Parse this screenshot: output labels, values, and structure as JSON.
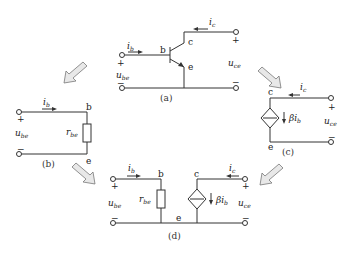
{
  "panels": {
    "a": {
      "caption": "(a)",
      "labels": {
        "ib": "i",
        "ib_sub": "b",
        "ic": "i",
        "ic_sub": "c",
        "b": "b",
        "c": "c",
        "e": "e",
        "ube": "u",
        "ube_sub": "be",
        "uce": "u",
        "uce_sub": "ce",
        "plus": "+",
        "minus": "−"
      }
    },
    "b": {
      "caption": "(b)",
      "labels": {
        "ib": "i",
        "ib_sub": "b",
        "b": "b",
        "e": "e",
        "rbe": "r",
        "rbe_sub": "be",
        "ube": "u",
        "ube_sub": "be",
        "plus": "+",
        "minus": "−"
      }
    },
    "c": {
      "caption": "(c)",
      "labels": {
        "ic": "i",
        "ic_sub": "c",
        "c": "c",
        "e": "e",
        "src": "βi",
        "src_sub": "b",
        "uce": "u",
        "uce_sub": "ce",
        "plus": "+",
        "minus": "−"
      }
    },
    "d": {
      "caption": "(d)",
      "labels": {
        "ib": "i",
        "ib_sub": "b",
        "ic": "i",
        "ic_sub": "c",
        "b": "b",
        "c": "c",
        "e": "e",
        "rbe": "r",
        "rbe_sub": "be",
        "src": "βi",
        "src_sub": "b",
        "ube": "u",
        "ube_sub": "be",
        "uce": "u",
        "uce_sub": "ce",
        "plus": "+",
        "minus": "−"
      }
    }
  },
  "colors": {
    "wire": "#333333",
    "arrow_fill": "#e8e8e8",
    "arrow_stroke": "#777777"
  }
}
